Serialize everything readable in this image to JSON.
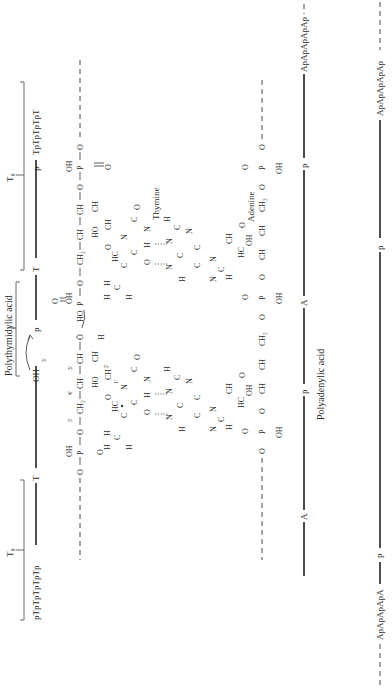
{
  "diagram": {
    "orientation": "rotated-90-ccw",
    "colors": {
      "ink": "#2b2b2b",
      "background": "#ffffff"
    },
    "top_strand": {
      "name": "Polythymidylic acid",
      "bracket_left_label": "T₀",
      "bracket_right_label": "T₀",
      "left_sequence": "pTpTpTpTpTp",
      "right_sequence": "TpTpTpTpT",
      "backbone_nodes": [
        "T",
        "OH",
        "3'",
        "p",
        "T",
        "p"
      ]
    },
    "bottom_strand": {
      "name": "Polyadenylic acid",
      "left_sequence": "ApApApApA",
      "right_sequence": "ApApApApAp",
      "backbone_nodes": [
        "p",
        "A",
        "p",
        "A",
        "p"
      ]
    },
    "base_labels": {
      "thymine": "Thymine",
      "adenine": "Adenine"
    },
    "atoms": {
      "OH": "OH",
      "HO": "HO",
      "O": "O",
      "P": "P",
      "CH2": "CH₂",
      "CH": "CH",
      "H": "H",
      "N": "N",
      "C": "C",
      "HC": "HC",
      "O_lone": "Ö",
      "p5": "5'",
      "p4": "4'",
      "p3": "3'",
      "p2": "2'",
      "p1": "1'"
    }
  }
}
